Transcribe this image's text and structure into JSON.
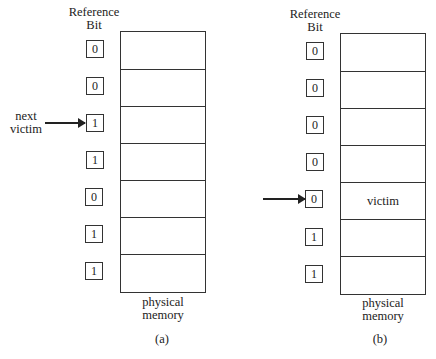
{
  "figure": {
    "panels": [
      {
        "id": "a",
        "header_line1": "Reference",
        "header_line2": "Bit",
        "bits": [
          "0",
          "0",
          "1",
          "1",
          "0",
          "1",
          "1"
        ],
        "frames": [
          "",
          "",
          "",
          "",
          "",
          "",
          ""
        ],
        "pointer_index": 2,
        "pointer_label_line1": "next",
        "pointer_label_line2": "victim",
        "memory_label_line1": "physical",
        "memory_label_line2": "memory",
        "caption": "(a)"
      },
      {
        "id": "b",
        "header_line1": "Reference",
        "header_line2": "Bit",
        "bits": [
          "0",
          "0",
          "0",
          "0",
          "0",
          "1",
          "1"
        ],
        "frames": [
          "",
          "",
          "",
          "",
          "victim",
          "",
          ""
        ],
        "pointer_index": 4,
        "pointer_label_line1": "",
        "pointer_label_line2": "",
        "memory_label_line1": "physical",
        "memory_label_line2": "memory",
        "caption": "(b)"
      }
    ]
  }
}
